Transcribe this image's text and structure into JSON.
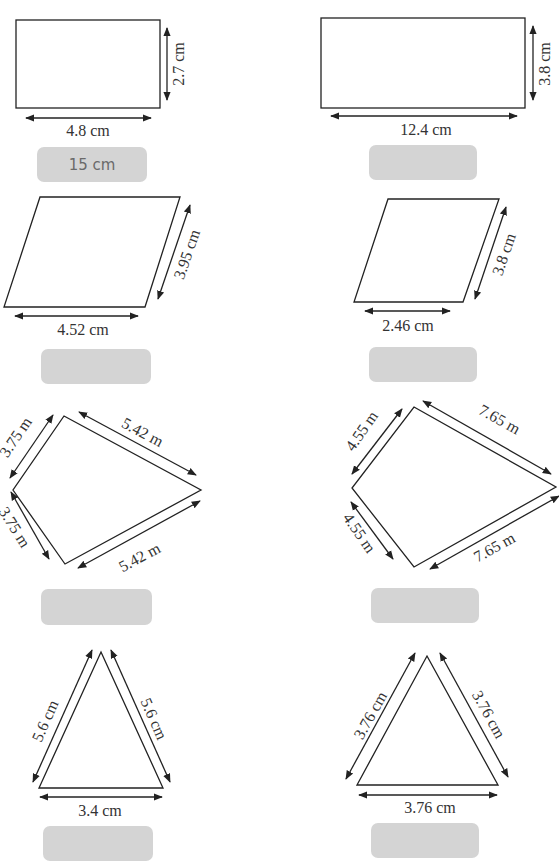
{
  "shapes": [
    {
      "type": "rectangle",
      "dims": {
        "height": "2.7 cm",
        "width": "4.8 cm"
      },
      "answer": "15 cm"
    },
    {
      "type": "rectangle",
      "dims": {
        "height": "3.8 cm",
        "width": "12.4 cm"
      },
      "answer": ""
    },
    {
      "type": "parallelogram",
      "dims": {
        "side": "3.95 cm",
        "base": "4.52 cm"
      },
      "answer": ""
    },
    {
      "type": "parallelogram",
      "dims": {
        "side": "3.8 cm",
        "base": "2.46 cm"
      },
      "answer": ""
    },
    {
      "type": "kite",
      "dims": {
        "top_left": "3.75 m",
        "top_right": "5.42 m",
        "bottom_left": "3.75 m",
        "bottom_right": "5.42 m"
      },
      "answer": ""
    },
    {
      "type": "kite",
      "dims": {
        "top_left": "4.55 m",
        "top_right": "7.65 m",
        "bottom_left": "4.55 m",
        "bottom_right": "7.65 m"
      },
      "answer": ""
    },
    {
      "type": "triangle",
      "dims": {
        "left": "5.6 cm",
        "right": "5.6 cm",
        "base": "3.4 cm"
      },
      "answer": ""
    },
    {
      "type": "triangle",
      "dims": {
        "left": "3.76 cm",
        "right": "3.76 cm",
        "base": "3.76 cm"
      },
      "answer": ""
    }
  ],
  "colors": {
    "stroke": "#222222",
    "answer_box": "#d4d4d4",
    "answer_text": "#6a6a6a"
  }
}
